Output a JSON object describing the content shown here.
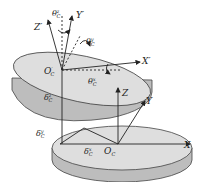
{
  "diagram": {
    "upper_disk": {
      "origin": "O",
      "origin_sub": "C",
      "origin_sup": "′",
      "axes": {
        "x": "X′",
        "y": "Y′",
        "z": "Z′"
      },
      "angles": {
        "theta_z": {
          "base": "θ",
          "sub": "C",
          "sup": "z"
        },
        "theta_y": {
          "base": "θ",
          "sub": "C",
          "sup": "y"
        },
        "theta_x": {
          "base": "θ",
          "sub": "C",
          "sup": "x"
        }
      },
      "delta_z": {
        "base": "δ",
        "sub": "C",
        "sup": "z"
      }
    },
    "lower_disk": {
      "origin": "O",
      "origin_sub": "C",
      "axes": {
        "x": "X",
        "y": "Y",
        "z": "Z"
      },
      "delta_y": {
        "base": "δ",
        "sub": "C",
        "sup": "y"
      },
      "delta_x": {
        "base": "δ",
        "sub": "C",
        "sup": "x"
      }
    },
    "colors": {
      "disk_top": "#dcdcdc",
      "disk_side": "#b9b9b9",
      "line": "#333333"
    }
  }
}
